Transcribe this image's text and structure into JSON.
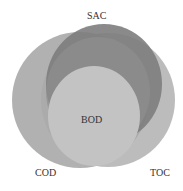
{
  "diagram": {
    "type": "venn",
    "sets": [
      {
        "id": "SAC",
        "label": "SAC",
        "color": "#7a7a7a"
      },
      {
        "id": "COD",
        "label": "COD",
        "color": "#a8a8a8"
      },
      {
        "id": "TOC",
        "label": "TOC",
        "color": "#b4b4b4"
      },
      {
        "id": "BOD",
        "label": "BOD",
        "color": "#c2c2c2"
      }
    ]
  },
  "labels": {
    "sac": "SAC",
    "cod": "COD",
    "toc": "TOC",
    "bod": "BOD"
  }
}
